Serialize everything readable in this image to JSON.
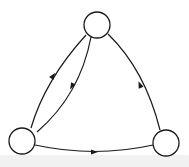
{
  "diagram": {
    "type": "directed-graph",
    "colors": {
      "stroke": "#1a1a1a",
      "node_fill": "#ffffff",
      "background": "#ffffff",
      "bottom_band": "#f1f1f1"
    },
    "nodes": [
      {
        "id": "top",
        "label": "",
        "cx": 97,
        "cy": 25,
        "r": 13
      },
      {
        "id": "bottom-left",
        "label": "",
        "cx": 22,
        "cy": 141,
        "r": 13
      },
      {
        "id": "bottom-right",
        "label": "",
        "cx": 166,
        "cy": 143,
        "r": 13
      }
    ],
    "edges": [
      {
        "id": "edge-outer-left",
        "from": "bottom-left",
        "to": "top",
        "path": "M31,128 Q45,80 86,35",
        "arrow": {
          "x": 53,
          "y": 76,
          "angle": -55
        }
      },
      {
        "id": "edge-inner-left",
        "from": "top",
        "to": "bottom-left",
        "path": "M91,37 Q80,95 37,132",
        "arrow": {
          "x": 72,
          "y": 86,
          "angle": 118
        }
      },
      {
        "id": "edge-right",
        "from": "bottom-right",
        "to": "top",
        "path": "M160,130 Q145,70 108,34",
        "arrow": {
          "x": 140,
          "y": 85,
          "angle": -112
        }
      },
      {
        "id": "edge-bottom",
        "from": "bottom-left",
        "to": "bottom-right",
        "path": "M35,145 Q95,158 153,145",
        "arrow": {
          "x": 94,
          "y": 152,
          "angle": 0
        }
      }
    ]
  }
}
